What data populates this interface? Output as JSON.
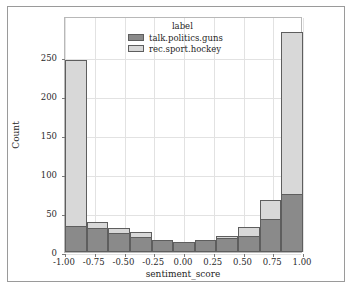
{
  "chart_data": {
    "type": "bar",
    "subtype": "stacked-histogram",
    "title": "",
    "xlabel": "sentiment_score",
    "ylabel": "Count",
    "legend_title": "label",
    "legend_position": "upper center",
    "grid": true,
    "xlim": [
      -1.0,
      1.0
    ],
    "ylim": [
      0,
      303
    ],
    "xticks": [
      "-1.00",
      "-0.75",
      "-0.50",
      "-0.25",
      "0.00",
      "0.25",
      "0.50",
      "0.75",
      "1.00"
    ],
    "xtick_values": [
      -1.0,
      -0.75,
      -0.5,
      -0.25,
      0.0,
      0.25,
      0.5,
      0.75,
      1.0
    ],
    "yticks": [
      "0",
      "50",
      "100",
      "150",
      "200",
      "250"
    ],
    "ytick_values": [
      0,
      50,
      100,
      150,
      200,
      250
    ],
    "bin_edges": [
      -1.0,
      -0.818,
      -0.636,
      -0.455,
      -0.273,
      -0.091,
      0.091,
      0.273,
      0.455,
      0.636,
      0.818,
      1.0
    ],
    "bin_centers": [
      -0.909,
      -0.727,
      -0.545,
      -0.364,
      -0.182,
      0.0,
      0.182,
      0.364,
      0.545,
      0.727,
      0.909
    ],
    "series": [
      {
        "name": "talk.politics.guns",
        "color": "#8a8a8a",
        "values": [
          33,
          31,
          24,
          19,
          16,
          13,
          16,
          18,
          21,
          29,
          43,
          75
        ]
      },
      {
        "name": "rec.sport.hockey",
        "color": "#d8d8d8",
        "values": [
          214,
          8,
          7,
          7,
          0,
          0,
          0,
          3,
          11,
          24,
          24,
          208
        ]
      }
    ],
    "bars": [
      {
        "center": -0.909,
        "dark": 33,
        "light": 214,
        "total": 247
      },
      {
        "center": -0.727,
        "dark": 31,
        "light": 8,
        "total": 39
      },
      {
        "center": -0.545,
        "dark": 24,
        "light": 7,
        "total": 31
      },
      {
        "center": -0.364,
        "dark": 19,
        "light": 7,
        "total": 26
      },
      {
        "center": -0.182,
        "dark": 16,
        "light": 0,
        "total": 16
      },
      {
        "center": 0.0,
        "dark": 13,
        "light": 0,
        "total": 13
      },
      {
        "center": 0.182,
        "dark": 16,
        "light": 0,
        "total": 16
      },
      {
        "center": 0.364,
        "dark": 18,
        "light": 3,
        "total": 21
      },
      {
        "center": 0.545,
        "dark": 21,
        "light": 11,
        "total": 32
      },
      {
        "center": 0.727,
        "dark": 29,
        "light": 24,
        "total": 53
      },
      {
        "center": 0.818,
        "dark": 43,
        "light": 24,
        "total": 67
      },
      {
        "center": 0.909,
        "dark": 75,
        "light": 208,
        "total": 283
      }
    ]
  },
  "legend": {
    "title": "label",
    "entries": [
      {
        "label": "talk.politics.guns",
        "color": "#8a8a8a"
      },
      {
        "label": "rec.sport.hockey",
        "color": "#d8d8d8"
      }
    ]
  },
  "axes": {
    "x_title": "sentiment_score",
    "y_title": "Count"
  }
}
